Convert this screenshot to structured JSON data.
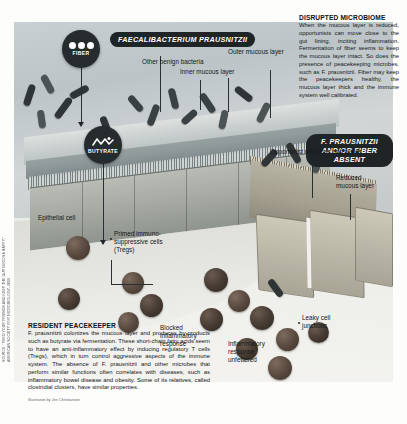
{
  "figure": {
    "title_pill_healthy": "FAECALIBACTERIUM PRAUSNITZII",
    "title_pill_disrupted": "F. PRAUSNITZII AND/OR FIBER ABSENT"
  },
  "badges": {
    "fiber": "FIBER",
    "butyrate": "BUTYRATE",
    "inflammation_inhibitors": "INFLAMMATION INHIBITORS"
  },
  "labels": {
    "other_benign_bacteria": "Other benign bacteria",
    "outer_mucous_layer": "Outer mucous layer",
    "inner_mucous_layer": "Inner mucous layer",
    "epithelial_cell": "Epithelial cell",
    "primed_tregs": "Primed immuno-suppressive cells (Tregs)",
    "blocked_inflammatory_response": "Blocked inflammatory response",
    "opportunist_microbes": "Opportunist microbes and toxins",
    "reduced_mucous_layer": "Reduced mucous layer",
    "leaky_cell_junctions": "Leaky cell junctions",
    "inflammatory_response_unfettered": "Inflammatory response unfettered"
  },
  "blocks": {
    "disrupted": {
      "heading": "DISRUPTED MICROBIOME",
      "body": "When the mucous layer is reduced, opportunists can move close to the gut lining, inciting inflammation. Fermentation of fiber seems to keep the mucous layer intact. So does the presence of peacekeeping microbes, such as F. prausnitzii. Fiber may keep the peacekeepers healthy, the mucous layer thick and the immune system well calibrated."
    },
    "peacekeeper": {
      "heading": "RESIDENT PEACEKEEPER",
      "body": "F. prausnitzii colonizes the mucous layer and produces by-products such as butyrate via fermentation. These short-chain fatty acids seem to have an anti-inflammatory effect by inducing regulatory T cells (Tregs), which in turn control aggressive aspects of the immune system. The absence of F. prausnitzii and other microbes that perform similar functions often correlates with diseases, such as inflammatory bowel disease and obesity. Some of its relatives, called clostridial clusters, have similar properties."
    }
  },
  "credits": {
    "source_vertical": "SOURCE: “FEED YOUR FRIENDS AND KEEP THE GUT MUCOSA HAPPY,” AMERICAN SOCIETY FOR MICROBIOLOGY, 2019",
    "illustration": "Illustration by Jen Christiansen"
  },
  "colors": {
    "badge_dark": "#262b2d",
    "pill_dark": "#1f2426",
    "text": "#15181a",
    "lumen": "#c5cbce"
  }
}
